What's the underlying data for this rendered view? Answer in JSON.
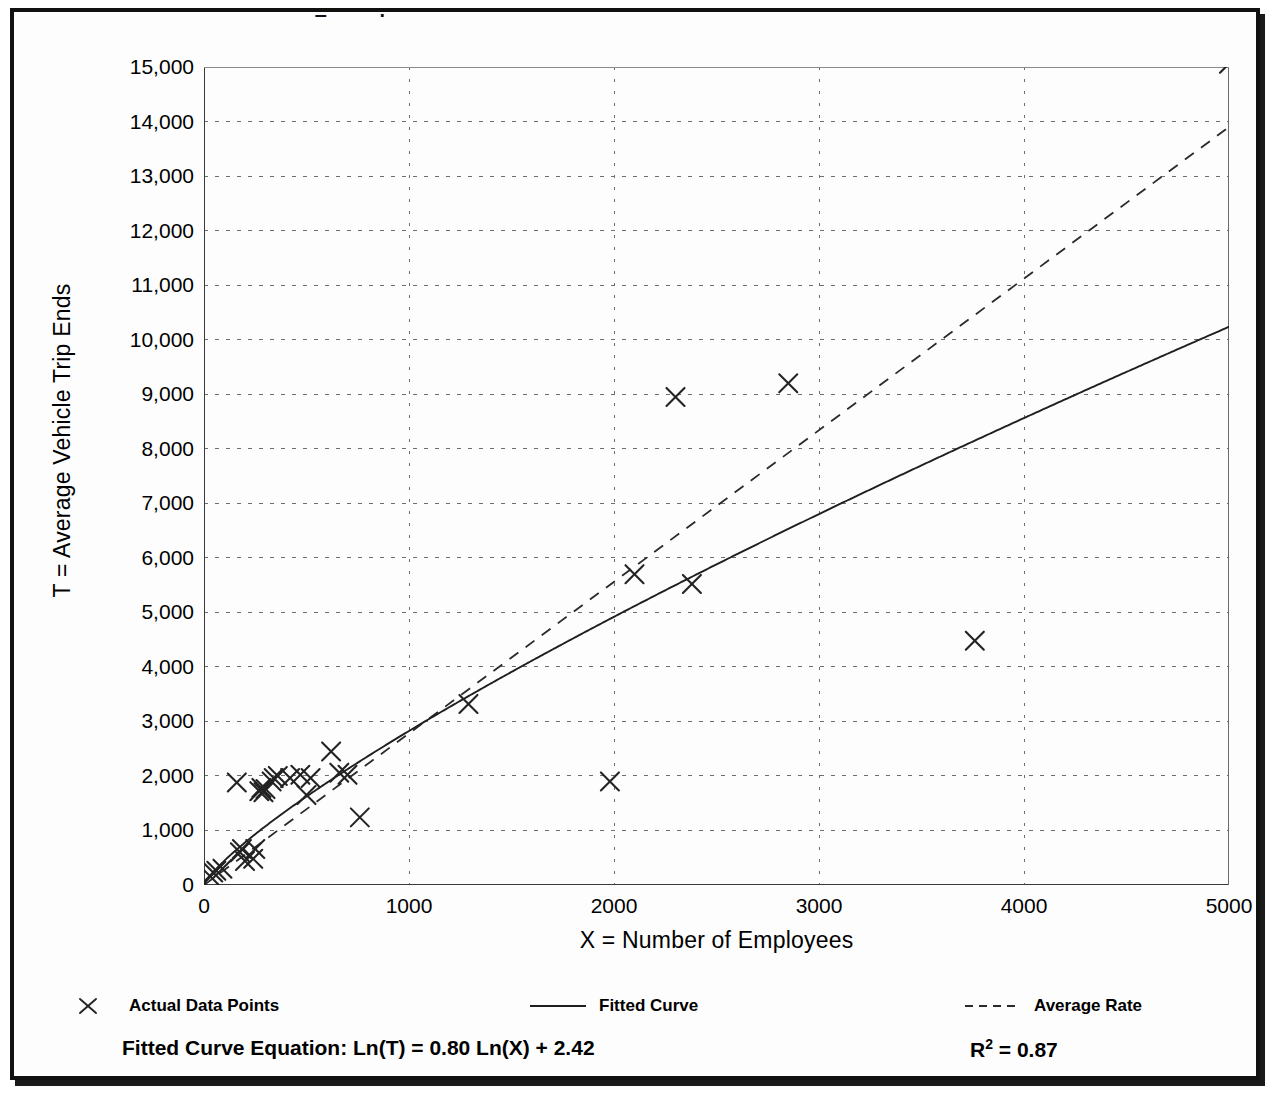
{
  "figure": {
    "cropped_title": "Example",
    "y_axis_title": "T = Average Vehicle Trip Ends",
    "x_axis_title": "X = Number of Employees",
    "equation_label": "Fitted Curve Equation:  Ln(T) = 0.80 Ln(X) + 2.42",
    "rsq_prefix": "R",
    "rsq_exponent": "2",
    "rsq_value": " = 0.87"
  },
  "legend": {
    "items": [
      {
        "label": "Actual Data Points",
        "marker": "x-marker",
        "style": "marker"
      },
      {
        "label": "Fitted Curve",
        "marker": "solid-line",
        "style": "solid"
      },
      {
        "label": "Average Rate",
        "marker": "dashed-line",
        "style": "dashed"
      }
    ]
  },
  "chart_data": {
    "type": "scatter",
    "title": "",
    "xlabel": "X = Number of Employees",
    "ylabel": "T = Average Vehicle Trip Ends",
    "xlim": [
      0,
      5000
    ],
    "ylim": [
      0,
      15000
    ],
    "xticks": [
      0,
      1000,
      2000,
      3000,
      4000,
      5000
    ],
    "xtick_labels": [
      "0",
      "1000",
      "2000",
      "3000",
      "4000",
      "5000"
    ],
    "yticks": [
      0,
      1000,
      2000,
      3000,
      4000,
      5000,
      6000,
      7000,
      8000,
      9000,
      10000,
      11000,
      12000,
      13000,
      14000,
      15000
    ],
    "ytick_labels": [
      "0",
      "1,000",
      "2,000",
      "3,000",
      "4,000",
      "5,000",
      "6,000",
      "7,000",
      "8,000",
      "9,000",
      "10,000",
      "11,000",
      "12,000",
      "13,000",
      "14,000",
      "15,000"
    ],
    "ytick_minor_step": 500,
    "grid": true,
    "grid_style": "dotted",
    "legend_position": "below",
    "series": [
      {
        "name": "Actual Data Points",
        "type": "scatter",
        "marker": "x",
        "points": [
          [
            30,
            160
          ],
          [
            45,
            230
          ],
          [
            60,
            260
          ],
          [
            90,
            300
          ],
          [
            160,
            1880
          ],
          [
            175,
            600
          ],
          [
            185,
            660
          ],
          [
            200,
            440
          ],
          [
            240,
            480
          ],
          [
            250,
            660
          ],
          [
            270,
            1720
          ],
          [
            280,
            1780
          ],
          [
            290,
            1700
          ],
          [
            300,
            1760
          ],
          [
            330,
            1900
          ],
          [
            340,
            1960
          ],
          [
            360,
            2000
          ],
          [
            420,
            1960
          ],
          [
            470,
            2020
          ],
          [
            500,
            1650
          ],
          [
            520,
            1960
          ],
          [
            620,
            2450
          ],
          [
            660,
            2060
          ],
          [
            700,
            2020
          ],
          [
            760,
            1240
          ],
          [
            1290,
            3320
          ],
          [
            1980,
            1900
          ],
          [
            2100,
            5700
          ],
          [
            2300,
            8950
          ],
          [
            2380,
            5520
          ],
          [
            2850,
            9200
          ],
          [
            3760,
            4480
          ],
          [
            5000,
            15060
          ]
        ]
      },
      {
        "name": "Fitted Curve",
        "type": "line",
        "style": "solid",
        "equation": "Ln(T) = 0.80 Ln(X) + 2.42",
        "a": 11.245,
        "b": 0.8,
        "r_squared": 0.87,
        "sample_points": [
          [
            0,
            0
          ],
          [
            100,
            450
          ],
          [
            250,
            930
          ],
          [
            500,
            1620
          ],
          [
            750,
            2230
          ],
          [
            1000,
            2810
          ],
          [
            1250,
            3350
          ],
          [
            1500,
            3870
          ],
          [
            2000,
            4880
          ],
          [
            2500,
            5800
          ],
          [
            3000,
            6680
          ],
          [
            3500,
            7520
          ],
          [
            4000,
            8330
          ],
          [
            4500,
            9120
          ],
          [
            5000,
            9880
          ]
        ]
      },
      {
        "name": "Average Rate",
        "type": "line",
        "style": "dashed",
        "slope": 2.78,
        "sample_points": [
          [
            0,
            0
          ],
          [
            5000,
            13900
          ]
        ]
      }
    ]
  }
}
